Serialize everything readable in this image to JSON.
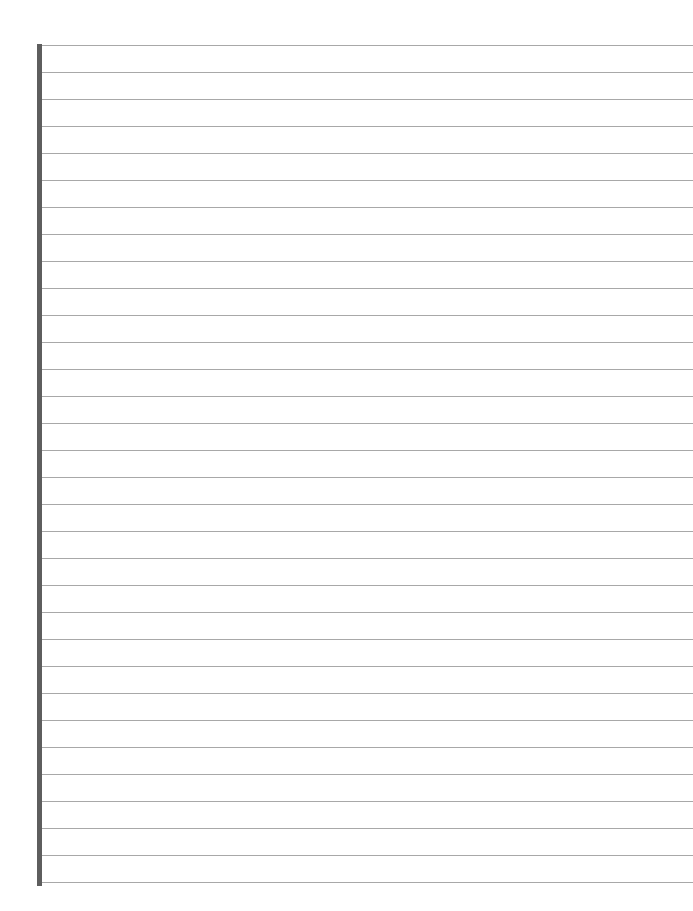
{
  "page": {
    "type": "blank lined paper",
    "line_count": 32,
    "line_spacing_px": 27,
    "colors": {
      "background": "#ffffff",
      "margin_bar": "#5e5e5e",
      "rule_line": "#a8a8a8"
    }
  }
}
